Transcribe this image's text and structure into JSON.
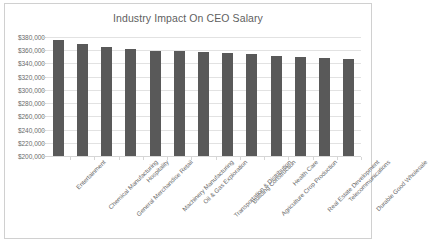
{
  "chart_data": {
    "type": "bar",
    "title": "Industry Impact On CEO Salary",
    "xlabel": "",
    "ylabel": "",
    "ylim": [
      200000,
      380000
    ],
    "ytick_values": [
      200000,
      220000,
      240000,
      260000,
      280000,
      300000,
      320000,
      340000,
      360000,
      380000
    ],
    "ytick_labels": [
      "$200,000",
      "$220,000",
      "$240,000",
      "$260,000",
      "$280,000",
      "$300,000",
      "$320,000",
      "$340,000",
      "$360,000",
      "$380,000"
    ],
    "grid": true,
    "legend": false,
    "legend_position": "none",
    "bar_color": "#595959",
    "categories": [
      "Entertainment",
      "Chemical Manufacturing",
      "General Merchandise Retail",
      "Hospitality",
      "Machinery Manufacturing",
      "Oil & Gas Exploration",
      "Transportation & Distribution",
      "Building Construction",
      "Agriculture Crop Production",
      "Health Care",
      "Real Estate Development",
      "Telecommunications",
      "Durable Good Wholesale"
    ],
    "values": [
      375000,
      369000,
      365500,
      362500,
      359500,
      359000,
      358000,
      356500,
      354000,
      351000,
      349500,
      348000,
      346500
    ]
  },
  "colors": {
    "bar": "#595959",
    "gridline": "#e2e2e2",
    "axis_text": "#6b6b6b",
    "title_text": "#5f5f5f",
    "frame_border": "#d0d0d0",
    "background": "#ffffff"
  }
}
